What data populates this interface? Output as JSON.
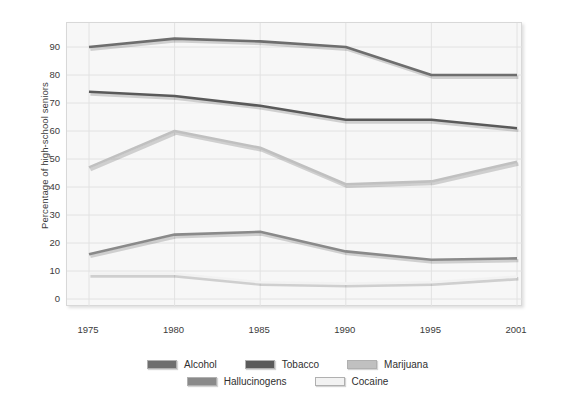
{
  "chart_data": {
    "type": "line",
    "title": "",
    "xlabel": "",
    "ylabel": "Percentage of high-school seniors",
    "x": [
      "1975",
      "1980",
      "1985",
      "1990",
      "1995",
      "2001"
    ],
    "categories": [
      "1975",
      "1980",
      "1985",
      "1990",
      "1995",
      "2001"
    ],
    "ylim": [
      0,
      95
    ],
    "yticks": [
      0,
      10,
      20,
      30,
      40,
      50,
      60,
      70,
      80,
      90
    ],
    "ytick_labels": [
      "0",
      "10",
      "20",
      "30",
      "40",
      "50",
      "60",
      "70",
      "80",
      "90"
    ],
    "grid": true,
    "legend_position": "bottom",
    "series": [
      {
        "name": "Alcohol",
        "color": "#6e6e6e",
        "values": [
          90,
          93,
          92,
          90,
          80,
          80
        ]
      },
      {
        "name": "Tobacco",
        "color": "#5a5a5a",
        "values": [
          74,
          72.5,
          69,
          64,
          64,
          61
        ]
      },
      {
        "name": "Marijuana",
        "color": "#c0c0c0",
        "values": [
          47,
          60,
          54,
          41,
          42,
          49
        ]
      },
      {
        "name": "Hallucinogens",
        "color": "#8a8a8a",
        "values": [
          16,
          23,
          24,
          17,
          14,
          14.5
        ]
      },
      {
        "name": "Cocaine",
        "color": "#f2f2f2",
        "values": [
          9,
          9,
          6,
          5.5,
          6,
          8
        ]
      }
    ]
  },
  "legend": {
    "rows": [
      [
        "Alcohol",
        "Tobacco",
        "Marijuana"
      ],
      [
        "Hallucinogens",
        "Cocaine"
      ]
    ]
  },
  "colors": {
    "plot_background": "#f7f7f7",
    "grid": "#e2e2e2",
    "frame": "#d8d8d8",
    "text": "#3b3b3b"
  }
}
